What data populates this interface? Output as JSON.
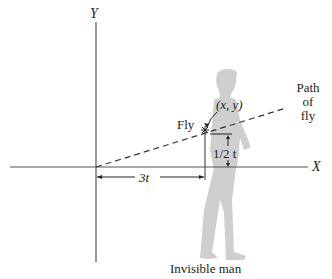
{
  "figure": {
    "axes": {
      "x_label": "X",
      "y_label": "Y"
    },
    "labels": {
      "fly": "Fly",
      "point": "(x, y)",
      "path_line1": "Path",
      "path_line2": "of",
      "path_line3": "fly",
      "horizontal_distance": "3t",
      "vertical_distance": "1/2 t",
      "man": "Invisible man"
    },
    "colors": {
      "axis": "#555555",
      "silhouette": "#c8c8c8",
      "text": "#222222"
    }
  }
}
